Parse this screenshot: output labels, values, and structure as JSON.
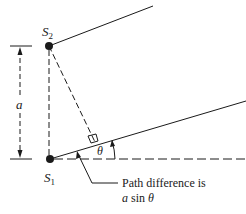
{
  "diagram": {
    "type": "double-slit path difference",
    "labels": {
      "source_top": {
        "main": "S",
        "sub": "2"
      },
      "source_bottom": {
        "main": "S",
        "sub": "1"
      },
      "separation": "a",
      "angle": "θ"
    },
    "caption": {
      "line1": "Path difference is",
      "line2_var": "a",
      "line2_fn": " sin ",
      "line2_angle": "θ"
    },
    "colors": {
      "ink": "#1a1a1a",
      "background": "#ffffff"
    }
  }
}
